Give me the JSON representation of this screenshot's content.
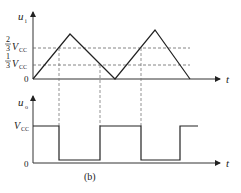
{
  "figure": {
    "caption": "(b)",
    "top_plot": {
      "y_label": "u",
      "y_label_sub": "i",
      "x_label": "t",
      "ticks": [
        {
          "num": "2",
          "den": "3",
          "text": "V",
          "sub": "CC"
        },
        {
          "num": "1",
          "den": "3",
          "text": "V",
          "sub": "CC"
        },
        {
          "text": "0"
        }
      ],
      "waveform": "triangle"
    },
    "bottom_plot": {
      "y_label": "u",
      "y_label_sub": "o",
      "x_label": "t",
      "ticks": [
        {
          "text": "V",
          "sub": "CC"
        },
        {
          "text": "0"
        }
      ],
      "waveform": "square"
    }
  }
}
